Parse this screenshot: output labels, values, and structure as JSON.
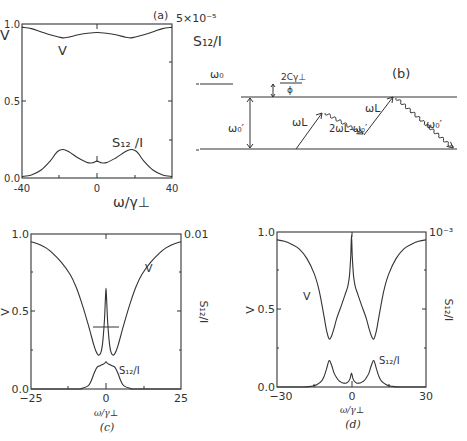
{
  "chart_data": [
    {
      "panel": "(a)",
      "type": "line",
      "xlabel": "ω/γ⊥",
      "ylabel_left": "V",
      "ylabel_right": "S12/I",
      "right_axis_top_label": "5×10⁻⁵",
      "xlim": [
        -40,
        40
      ],
      "ylim": [
        0.0,
        1.0
      ],
      "x_ticks": [
        "-40",
        "0",
        "40"
      ],
      "y_ticks": [
        "0.0",
        "0.5",
        "1.0"
      ],
      "series": [
        {
          "name": "V",
          "label": "V",
          "x": [
            -40,
            -35,
            -30,
            -25,
            -20,
            -18,
            -15,
            -10,
            -5,
            0,
            5,
            10,
            15,
            18,
            20,
            25,
            30,
            35,
            40
          ],
          "y": [
            0.98,
            0.97,
            0.95,
            0.93,
            0.915,
            0.91,
            0.915,
            0.93,
            0.94,
            0.945,
            0.94,
            0.93,
            0.915,
            0.91,
            0.915,
            0.93,
            0.95,
            0.97,
            0.98
          ]
        },
        {
          "name": "S12/I",
          "label": "S₁₂/I",
          "x": [
            -40,
            -35,
            -30,
            -25,
            -22,
            -20,
            -18,
            -15,
            -10,
            -5,
            -2,
            0,
            2,
            5,
            10,
            15,
            18,
            20,
            22,
            25,
            30,
            35,
            40
          ],
          "y": [
            0.01,
            0.02,
            0.05,
            0.11,
            0.16,
            0.18,
            0.185,
            0.17,
            0.13,
            0.1,
            0.1,
            0.11,
            0.1,
            0.1,
            0.13,
            0.17,
            0.185,
            0.18,
            0.16,
            0.11,
            0.05,
            0.02,
            0.01
          ]
        }
      ]
    },
    {
      "panel": "(c)",
      "type": "line",
      "xlabel": "ω/γ⊥",
      "ylabel_left": "V",
      "ylabel_right": "S12/I",
      "right_axis_top_label": "0.01",
      "xlim": [
        -25,
        25
      ],
      "ylim": [
        0.0,
        1.0
      ],
      "x_ticks": [
        "−25",
        "0",
        "25"
      ],
      "y_ticks": [
        "0.0",
        "0.5",
        "1.0"
      ],
      "series": [
        {
          "name": "V",
          "label": "V",
          "x": [
            -25,
            -22,
            -20,
            -18,
            -15,
            -12,
            -10,
            -8,
            -6,
            -4,
            -3,
            -2.2,
            -1.5,
            -1,
            -0.5,
            -0.2,
            0,
            0.2,
            0.5,
            1,
            1.5,
            2.2,
            3,
            4,
            6,
            8,
            10,
            12,
            15,
            18,
            20,
            22,
            25
          ],
          "y": [
            0.95,
            0.93,
            0.91,
            0.88,
            0.82,
            0.74,
            0.66,
            0.55,
            0.42,
            0.28,
            0.23,
            0.22,
            0.25,
            0.32,
            0.45,
            0.58,
            0.65,
            0.58,
            0.45,
            0.32,
            0.25,
            0.22,
            0.23,
            0.28,
            0.42,
            0.55,
            0.66,
            0.74,
            0.82,
            0.88,
            0.91,
            0.93,
            0.95
          ]
        },
        {
          "name": "S12/I",
          "label": "S₁₂/I",
          "x": [
            -25,
            -10,
            -8,
            -6,
            -5,
            -4,
            -3,
            -2,
            -1,
            -0.5,
            0,
            0.5,
            1,
            2,
            3,
            4,
            5,
            6,
            8,
            10,
            25
          ],
          "y": [
            0.0,
            0.0,
            0.005,
            0.02,
            0.05,
            0.1,
            0.14,
            0.15,
            0.16,
            0.165,
            0.175,
            0.165,
            0.16,
            0.15,
            0.14,
            0.1,
            0.05,
            0.02,
            0.005,
            0.0,
            0.0
          ]
        }
      ]
    },
    {
      "panel": "(d)",
      "type": "line",
      "xlabel": "ω/γ⊥",
      "ylabel_left": "V",
      "ylabel_right": "S12/I",
      "right_axis_top_label": "10⁻³",
      "xlim": [
        -30,
        30
      ],
      "ylim": [
        0.0,
        1.0
      ],
      "x_ticks": [
        "−30",
        "0",
        "30"
      ],
      "y_ticks": [
        "0.0",
        "0.5",
        "1.0"
      ],
      "series": [
        {
          "name": "V",
          "label": "V",
          "x": [
            -30,
            -27,
            -24,
            -21,
            -18,
            -15,
            -13,
            -11,
            -10,
            -9,
            -8,
            -7,
            -6,
            -4,
            -2.5,
            -1.5,
            -0.8,
            -0.3,
            0,
            0.3,
            0.8,
            1.5,
            2.5,
            4,
            6,
            7,
            8,
            9,
            10,
            11,
            13,
            15,
            18,
            21,
            24,
            27,
            30
          ],
          "y": [
            0.95,
            0.94,
            0.92,
            0.89,
            0.83,
            0.73,
            0.62,
            0.45,
            0.36,
            0.31,
            0.33,
            0.38,
            0.44,
            0.53,
            0.6,
            0.65,
            0.72,
            0.85,
            0.98,
            0.85,
            0.72,
            0.65,
            0.6,
            0.53,
            0.44,
            0.38,
            0.33,
            0.31,
            0.36,
            0.45,
            0.62,
            0.73,
            0.83,
            0.89,
            0.92,
            0.94,
            0.95
          ]
        },
        {
          "name": "S12/I",
          "label": "S₁₂/I",
          "x": [
            -30,
            -20,
            -16,
            -14,
            -12,
            -11,
            -10,
            -9,
            -8,
            -7,
            -6,
            -5,
            -4,
            -3,
            -2,
            -1,
            -0.5,
            0,
            0.5,
            1,
            2,
            3,
            4,
            5,
            6,
            7,
            8,
            9,
            10,
            11,
            12,
            14,
            16,
            20,
            30
          ],
          "y": [
            0.0,
            0.0,
            0.005,
            0.015,
            0.04,
            0.07,
            0.12,
            0.17,
            0.14,
            0.09,
            0.06,
            0.04,
            0.03,
            0.025,
            0.025,
            0.04,
            0.06,
            0.09,
            0.06,
            0.04,
            0.025,
            0.025,
            0.03,
            0.04,
            0.06,
            0.09,
            0.14,
            0.17,
            0.12,
            0.07,
            0.04,
            0.015,
            0.005,
            0.0,
            0.0
          ]
        }
      ]
    }
  ],
  "panel_a": {
    "tag": "(a)",
    "xlabel": "ω/γ⊥",
    "ylabel": "V",
    "right_top": "5×10⁻⁵",
    "right_label": "S₁₂/I",
    "curve_v_label": "V",
    "curve_s_label": "S₁₂ /I",
    "xt": [
      "-40",
      "0",
      "40"
    ],
    "yt": [
      "0.0",
      "0.5",
      "1.0"
    ]
  },
  "panel_b": {
    "tag": "(b)",
    "omega0": "ω₀",
    "omega0_prime": "ω₀′",
    "shift_num": "2Cγ⊥",
    "shift_den": "ϕ",
    "omegaL_1": "ωL",
    "omegaL_2": "ωL",
    "four_wave": "2ωL-ω₀′",
    "emitted": "ω₀′"
  },
  "panel_c": {
    "tag": "(c)",
    "xlabel": "ω/γ⊥",
    "ylabel": "V",
    "right_top": "0.01",
    "right_label": "S₁₂/I",
    "curve_v_label": "V",
    "curve_s_label": "S₁₂/I",
    "xt": [
      "−25",
      "0",
      "25"
    ],
    "yt": [
      "0.0",
      "0.5",
      "1.0"
    ]
  },
  "panel_d": {
    "tag": "(d)",
    "xlabel": "ω/γ⊥",
    "ylabel": "V",
    "right_top": "10⁻³",
    "right_label": "S₁₂/I",
    "curve_v_label": "V",
    "curve_s_label": "S₁₂/I",
    "xt": [
      "−30",
      "0",
      "30"
    ],
    "yt": [
      "0.0",
      "0.5",
      "1.0"
    ]
  }
}
